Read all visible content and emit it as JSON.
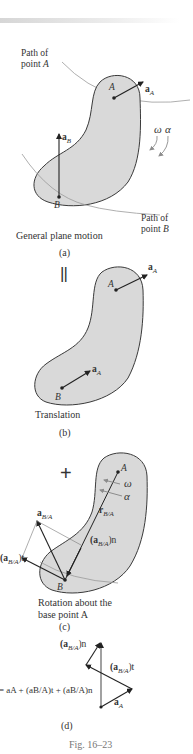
{
  "figure": {
    "number_label": "Fig. 16–23",
    "panels": [
      {
        "id": "a",
        "subcaption": "(a)",
        "caption": "General plane motion",
        "labels": {
          "path_a_line1": "Path of",
          "path_a_line2": "point A",
          "path_b_line1": "Path of",
          "path_b_line2": "point B",
          "point_a": "A",
          "point_b": "B",
          "accel_a": "a",
          "accel_a_sub": "A",
          "accel_b": "a",
          "accel_b_sub": "B",
          "omega": "ω",
          "alpha": "α"
        }
      },
      {
        "id": "b",
        "subcaption": "(b)",
        "caption": "Translation",
        "operator": "||",
        "labels": {
          "point_a": "A",
          "point_b": "B",
          "accel_a": "a",
          "accel_a_sub": "A",
          "accel_at_b": "a",
          "accel_at_b_sub": "A"
        }
      },
      {
        "id": "c",
        "subcaption": "(c)",
        "caption_line1": "Rotation about the",
        "caption_line2": "base point A",
        "operator": "+",
        "labels": {
          "point_a": "A",
          "point_b": "B",
          "omega": "ω",
          "alpha": "α",
          "r_ba": "r",
          "r_ba_sub": "B/A",
          "a_ba": "a",
          "a_ba_sub": "B/A",
          "a_ba_t": "(a",
          "a_ba_t_sub": "B/A",
          "a_ba_t_end": ")t",
          "a_ba_n": "(a",
          "a_ba_n_sub": "B/A",
          "a_ba_n_end": ")n"
        }
      },
      {
        "id": "d",
        "subcaption": "(d)",
        "equation": "= aA + (aB/A)t + (aB/A)n",
        "labels": {
          "a_ba_n": "(a",
          "a_ba_n_sub": "B/A",
          "a_ba_n_end": ")n",
          "a_ba_t": "(a",
          "a_ba_t_sub": "B/A",
          "a_ba_t_end": ")t",
          "a_a": "a",
          "a_a_sub": "A"
        }
      }
    ]
  },
  "colors": {
    "body_fill": "#d9d9d9",
    "body_stroke": "#3a3a3a",
    "path_stroke": "#9a9a9a",
    "vector": "#222222",
    "rotation_arrow": "#8c8c8c",
    "text": "#333333"
  }
}
